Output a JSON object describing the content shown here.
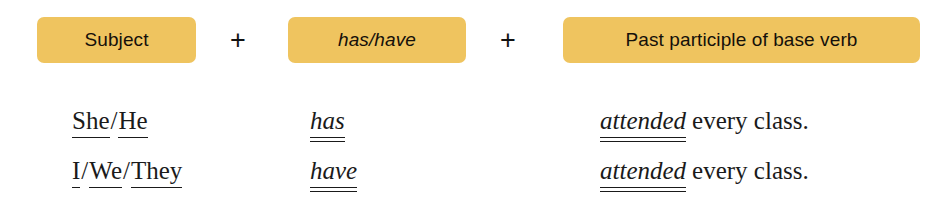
{
  "formula": {
    "boxes": [
      {
        "label": "Subject",
        "style": "normal"
      },
      {
        "label": "has/have",
        "style": "italic"
      },
      {
        "label": "Past participle of base verb",
        "style": "normal"
      }
    ],
    "operators": [
      "+",
      "+"
    ],
    "box_color": "#efc45f",
    "text_color": "#15100a"
  },
  "examples": [
    {
      "subject": {
        "words": [
          "She",
          "He"
        ],
        "separator": "/"
      },
      "auxiliary": "has",
      "participle": "attended",
      "predicate_tail": "every class."
    },
    {
      "subject": {
        "words": [
          "I",
          "We",
          "They"
        ],
        "separator": "/"
      },
      "auxiliary": "have",
      "participle": "attended",
      "predicate_tail": "every class."
    }
  ]
}
